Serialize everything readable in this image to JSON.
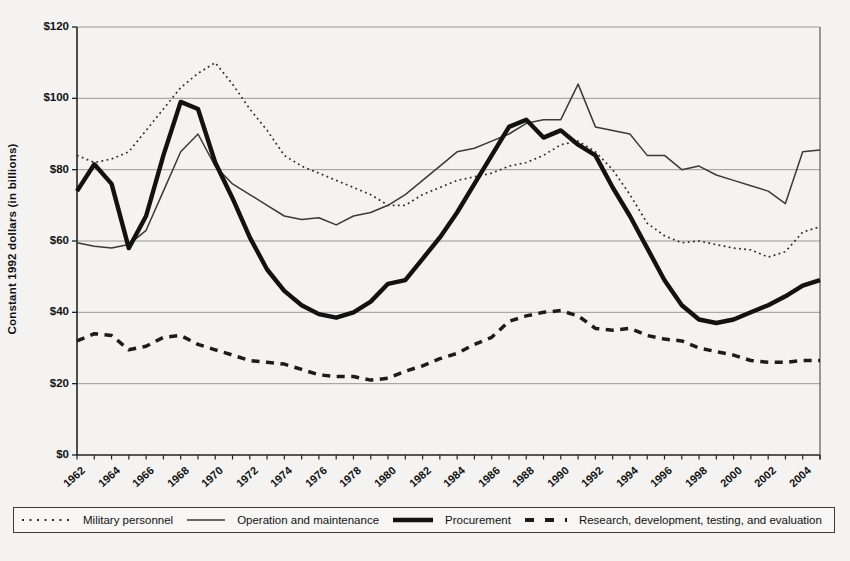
{
  "page": {
    "background_color": "#f4f3f1",
    "line_color": "#1a1a1a",
    "grid_color": "#8f8f8f"
  },
  "chart_data": {
    "type": "line",
    "title": "",
    "xlabel": "",
    "ylabel": "Constant 1992 dollars (in billions)",
    "ylim": [
      0,
      120
    ],
    "xlim": [
      1962,
      2005
    ],
    "grid": "horizontal",
    "legend_position": "bottom",
    "yticks": [
      {
        "label": "$120",
        "value": 120
      },
      {
        "label": "$100",
        "value": 100
      },
      {
        "label": "$80",
        "value": 80
      },
      {
        "label": "$60",
        "value": 60
      },
      {
        "label": "$40",
        "value": 40
      },
      {
        "label": "$20",
        "value": 20
      },
      {
        "label": "$0",
        "value": 0
      }
    ],
    "xtick_labels": [
      1962,
      1964,
      1966,
      1968,
      1970,
      1972,
      1974,
      1976,
      1978,
      1980,
      1982,
      1984,
      1986,
      1988,
      1990,
      1992,
      1994,
      1996,
      1998,
      2000,
      2002,
      2004
    ],
    "x_years": [
      1962,
      1963,
      1964,
      1965,
      1966,
      1967,
      1968,
      1969,
      1970,
      1971,
      1972,
      1973,
      1974,
      1975,
      1976,
      1977,
      1978,
      1979,
      1980,
      1981,
      1982,
      1983,
      1984,
      1985,
      1986,
      1987,
      1988,
      1989,
      1990,
      1991,
      1992,
      1993,
      1994,
      1995,
      1996,
      1997,
      1998,
      1999,
      2000,
      2001,
      2002,
      2003,
      2004,
      2005
    ],
    "series": [
      {
        "name": "Military personnel",
        "style": "dotted",
        "values": [
          84,
          82,
          83,
          85,
          91,
          97,
          103,
          107,
          110,
          104,
          97,
          91,
          84,
          81,
          79,
          77,
          75,
          73,
          70,
          70,
          73,
          75,
          77,
          78,
          79,
          81,
          82,
          84,
          87,
          88,
          85,
          80,
          73,
          65,
          61.5,
          59.5,
          60,
          59,
          58,
          57.5,
          55.5,
          57,
          62.5,
          64
        ]
      },
      {
        "name": "Operation and maintenance",
        "style": "thin-solid",
        "values": [
          59.5,
          58.5,
          58,
          59,
          63,
          74,
          85,
          90,
          81,
          76,
          73,
          70,
          67,
          66,
          66.5,
          64.5,
          67,
          68,
          70,
          73,
          77,
          81,
          85,
          86,
          88,
          90,
          93,
          94,
          94,
          104,
          92,
          91,
          90,
          84,
          84,
          80,
          81,
          78.5,
          77,
          75.5,
          74,
          70.5,
          85,
          85.5
        ]
      },
      {
        "name": "Procurement",
        "style": "thick-solid",
        "values": [
          74,
          81.5,
          76,
          58,
          67,
          84,
          99,
          97,
          82,
          72,
          61,
          52,
          46,
          42,
          39.5,
          38.5,
          40,
          43,
          48,
          49,
          55,
          61,
          68,
          76,
          84,
          92,
          94,
          89,
          91,
          87,
          84,
          75,
          67,
          58,
          49,
          42,
          38,
          37,
          38,
          40,
          42,
          44.5,
          47.5,
          49
        ]
      },
      {
        "name": "Research, development, testing, and evaluation",
        "style": "thick-dashed",
        "values": [
          32,
          34,
          33.5,
          29.5,
          30.5,
          33,
          33.5,
          31,
          29.5,
          28,
          26.5,
          26,
          25.5,
          24,
          22.5,
          22,
          22,
          21,
          21.5,
          23.5,
          25,
          27,
          28.5,
          31,
          33,
          37.5,
          39,
          40,
          40.5,
          39,
          35.5,
          35,
          35.5,
          33.5,
          32.5,
          32,
          30,
          29,
          28,
          26.5,
          26,
          26,
          26.5,
          26.5
        ]
      }
    ]
  }
}
